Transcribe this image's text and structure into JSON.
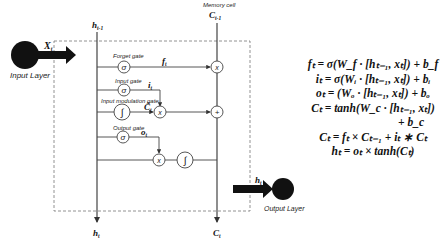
{
  "diagram": {
    "type": "lstm-cell",
    "input_layer": {
      "label": "Input Layer",
      "input_symbol": "X_t"
    },
    "output_layer": {
      "label": "Output Layer",
      "output_symbol": "h_t"
    },
    "hidden_in": {
      "symbol": "h_{t-1}"
    },
    "hidden_out": {
      "symbol": "h_t"
    },
    "memory_cell": {
      "label": "Memory cell",
      "in_symbol": "C_{t-1}",
      "out_symbol": "C_t"
    },
    "gates": [
      {
        "name": "Forget gate",
        "activation": "σ",
        "output": "f_t"
      },
      {
        "name": "Input gate",
        "activation": "σ",
        "output": "i_t"
      },
      {
        "name": "Input modulation gate",
        "activation": "∫",
        "output": "C̃_t"
      },
      {
        "name": "Output gate",
        "activation": "σ",
        "output": "o_t"
      }
    ],
    "operators": [
      "×",
      "×",
      "+",
      "×",
      "∫"
    ]
  },
  "labels": {
    "input_layer": "Input Layer",
    "output_layer": "Output Layer",
    "memory_cell": "Memory cell",
    "forget_gate": "Forget gate",
    "input_gate": "Input gate",
    "input_mod_gate": "Input modulation gate",
    "output_gate": "Output gate",
    "xt": "X",
    "xt_sub": "t",
    "h_prev": "h",
    "h_prev_sub": "t-1",
    "c_prev": "C",
    "c_prev_sub": "t-1",
    "ft": "f",
    "ft_sub": "t",
    "it": "i",
    "it_sub": "t",
    "ct_tilde": "C̃",
    "ct_tilde_sub": "t",
    "ot": "o",
    "ot_sub": "t",
    "ht_out": "h",
    "ht_out_sub": "t",
    "ht_bottom": "h",
    "ht_bottom_sub": "t",
    "ct_bottom": "C",
    "ct_bottom_sub": "t",
    "sigma": "σ",
    "tanh_glyph": "∫",
    "times": "x",
    "plus": "+"
  },
  "equations": [
    "f_t = σ(W_f · [h_{t−1}, x_t]) + b_f",
    "i_t = σ(W_i · [h_{t−1}, x_t]) + b_i",
    "o_t = (W_o · [h_{t−1}, x_t]) + b_o",
    "C_t = tanh(W_c · [h_{t−1}, x_t])",
    "+ b_c",
    "C_t = f_t × C_{t−1} + i_t ∗ C_t",
    "h_t = o_t × tanh(C_t)"
  ],
  "equations_display": {
    "eq1": "fₜ = σ(W_f · [hₜ₋₁, xₜ]) + b_f",
    "eq2": "iₜ = σ(Wᵢ · [hₜ₋₁, xₜ]) + bᵢ",
    "eq3": "oₜ = (Wₒ · [hₜ₋₁, xₜ]) + bₒ",
    "eq4": "Cₜ = tanh(W_c · [hₜ₋₁, xₜ])",
    "eq5": "+ b_c",
    "eq6": "Cₜ = fₜ × Cₜ₋₁ + iₜ ∗ Cₜ",
    "eq7": "hₜ = oₜ × tanh(Cₜ)"
  }
}
